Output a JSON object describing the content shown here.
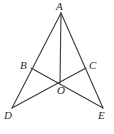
{
  "figure": {
    "background_color": "#ffffff",
    "stroke_color": "#3a3a3a",
    "label_color": "#2b2b2b",
    "stroke_width": 1.1,
    "points": {
      "A": {
        "label": "A",
        "x": 61,
        "y": 13,
        "label_x": 56,
        "label_y": 1
      },
      "B": {
        "label": "B",
        "x": 31,
        "y": 68,
        "label_x": 20,
        "label_y": 60
      },
      "C": {
        "label": "C",
        "x": 86,
        "y": 68,
        "label_x": 89,
        "label_y": 60
      },
      "D": {
        "label": "D",
        "x": 12,
        "y": 108,
        "label_x": 4,
        "label_y": 110
      },
      "E": {
        "label": "E",
        "x": 103,
        "y": 108,
        "label_x": 98,
        "label_y": 110
      },
      "O": {
        "label": "O",
        "x": 60,
        "y": 83,
        "label_x": 57,
        "label_y": 85
      }
    },
    "segments": [
      {
        "name": "segment-AD",
        "from": "A",
        "to": "D"
      },
      {
        "name": "segment-AE",
        "from": "A",
        "to": "E"
      },
      {
        "name": "segment-DE-left",
        "from": "D",
        "to": "O"
      },
      {
        "name": "segment-AO",
        "from": "A",
        "to": "O"
      },
      {
        "name": "segment-BE",
        "from": "B",
        "to": "E"
      },
      {
        "name": "segment-CD",
        "from": "C",
        "to": "D"
      }
    ]
  }
}
